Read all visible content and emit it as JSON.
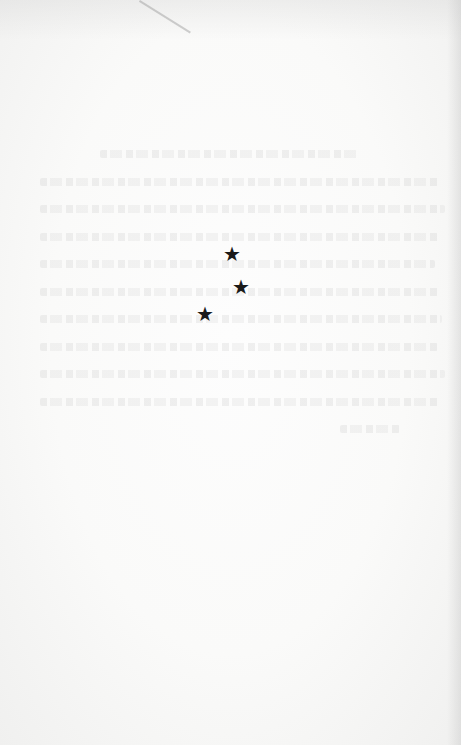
{
  "document": {
    "type": "blank book page (verso) with section-break ornament",
    "ornament": {
      "name": "asterism",
      "glyphs": [
        "★",
        "★",
        "★"
      ]
    },
    "show_through_text_lines": 10,
    "colors": {
      "paper": "#f7f7f6",
      "ink": "#1a1a1a"
    }
  }
}
